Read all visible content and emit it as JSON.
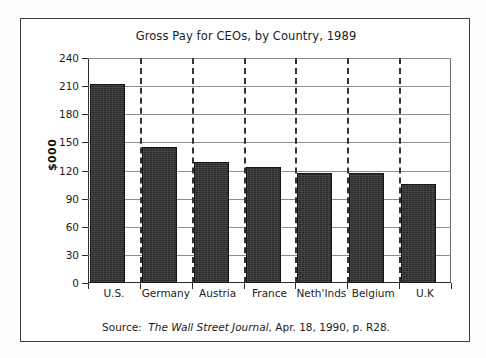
{
  "figure": {
    "title": "Gross Pay for CEOs, by Country, 1989",
    "ylabel": "$000",
    "source_prefix": "Source:",
    "source_publication": "The Wall Street Journal",
    "source_suffix": ", Apr. 18, 1990, p. R28."
  },
  "chart_data": {
    "type": "bar",
    "title": "Gross Pay for CEOs, by Country, 1989",
    "xlabel": "",
    "ylabel": "$000",
    "categories": [
      "U.S.",
      "Germany",
      "Austria",
      "France",
      "Neth'Inds",
      "Belgium",
      "U.K"
    ],
    "values": [
      212,
      145,
      129,
      124,
      117,
      117,
      106
    ],
    "ylim": [
      0,
      240
    ],
    "yticks": [
      0,
      30,
      60,
      90,
      120,
      150,
      180,
      210,
      240
    ],
    "ytick_labels": [
      "0",
      "30",
      "60",
      "90",
      "120",
      "150",
      "180",
      "210",
      "240"
    ],
    "grid": true,
    "grid_axis": "y",
    "legend": null,
    "bar_color": "#2a2a2a",
    "separators": "dashed vertical lines between categories",
    "annotations": [
      "Source: The Wall Street Journal, Apr. 18, 1990, p. R28."
    ]
  }
}
